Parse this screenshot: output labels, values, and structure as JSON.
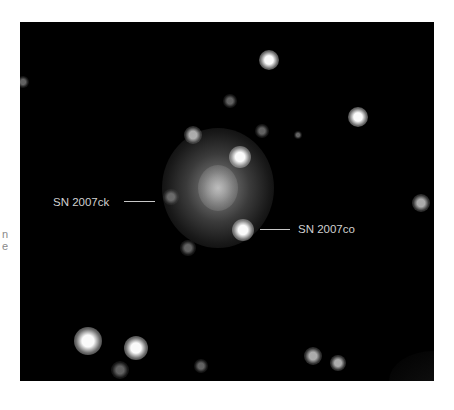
{
  "figure": {
    "type": "astronomical-image",
    "background_color": "#000000",
    "page_background": "#ffffff",
    "edge_fragments": [
      {
        "text": "n",
        "y": 234
      },
      {
        "text": "e",
        "y": 246
      }
    ],
    "galaxy": {
      "cx": 218,
      "cy": 188,
      "rx": 56,
      "ry": 60
    },
    "labels": [
      {
        "id": "sn2007ck",
        "text": "SN 2007ck",
        "x": 53,
        "y": 195,
        "line_x1": 124,
        "line_x2": 155,
        "line_y": 201
      },
      {
        "id": "sn2007co",
        "text": "SN 2007co",
        "x": 298,
        "y": 222,
        "line_x1": 260,
        "line_x2": 290,
        "line_y": 229
      }
    ],
    "stars": [
      {
        "x": 269,
        "y": 60,
        "r": 10,
        "b": "bright"
      },
      {
        "x": 358,
        "y": 117,
        "r": 10,
        "b": "bright"
      },
      {
        "x": 240,
        "y": 157,
        "r": 11,
        "b": "bright"
      },
      {
        "x": 243,
        "y": 230,
        "r": 11,
        "b": "bright"
      },
      {
        "x": 193,
        "y": 135,
        "r": 9,
        "b": "medium"
      },
      {
        "x": 262,
        "y": 131,
        "r": 7,
        "b": "faint"
      },
      {
        "x": 230,
        "y": 101,
        "r": 7,
        "b": "faint"
      },
      {
        "x": 298,
        "y": 135,
        "r": 4,
        "b": "faint"
      },
      {
        "x": 171,
        "y": 197,
        "r": 8,
        "b": "faint"
      },
      {
        "x": 188,
        "y": 248,
        "r": 8,
        "b": "faint"
      },
      {
        "x": 421,
        "y": 203,
        "r": 9,
        "b": "medium"
      },
      {
        "x": 23,
        "y": 82,
        "r": 6,
        "b": "faint"
      },
      {
        "x": 88,
        "y": 341,
        "r": 14,
        "b": "bright"
      },
      {
        "x": 136,
        "y": 348,
        "r": 12,
        "b": "bright"
      },
      {
        "x": 120,
        "y": 370,
        "r": 9,
        "b": "faint"
      },
      {
        "x": 201,
        "y": 366,
        "r": 7,
        "b": "faint"
      },
      {
        "x": 313,
        "y": 356,
        "r": 9,
        "b": "medium"
      },
      {
        "x": 338,
        "y": 363,
        "r": 8,
        "b": "medium"
      }
    ]
  }
}
